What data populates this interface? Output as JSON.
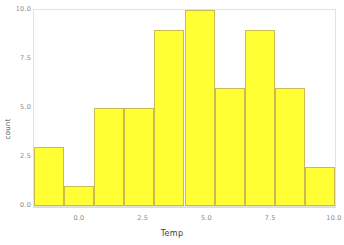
{
  "chart_data": {
    "type": "bar",
    "title": "",
    "subtitle": "",
    "xlabel": "Temp",
    "ylabel": "count",
    "categories": [
      "-1.5",
      "-0.5",
      "0.5",
      "1.5",
      "2.5",
      "3.5",
      "4.5",
      "5.5",
      "6.5",
      "7.5"
    ],
    "values": [
      3,
      1,
      5,
      5,
      9,
      10,
      6,
      9,
      6,
      2
    ],
    "bin_edges": [
      -1.8,
      -0.62,
      0.56,
      1.74,
      2.92,
      4.1,
      5.28,
      6.46,
      7.64,
      8.82,
      10.0
    ],
    "xlim": [
      -1.8,
      10.0
    ],
    "ylim": [
      0,
      10
    ],
    "xticks": [
      0.0,
      2.5,
      5.0,
      7.5,
      10.0
    ],
    "xtick_labels": [
      "0.0",
      "2.5",
      "5.0",
      "7.5",
      "10.0"
    ],
    "yticks": [
      0.0,
      2.5,
      5.0,
      7.5,
      10.0
    ],
    "ytick_labels": [
      "0.0",
      "2.5",
      "5.0",
      "7.5",
      "10.0"
    ],
    "grid": false,
    "legend": null,
    "bar_fill_color": "#FFFF33",
    "bar_stroke_color": "#C9BA52",
    "panel_background": "#FFFFFF",
    "panel_border_color": "#E2E2E2",
    "tick_label_color": "#8A8A8A",
    "axis_title_color": "#3D3D3D"
  }
}
